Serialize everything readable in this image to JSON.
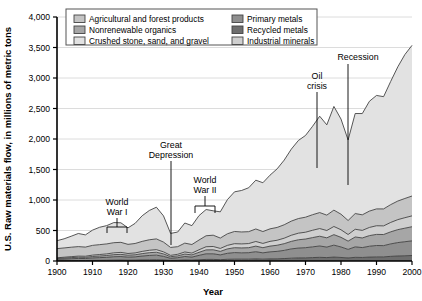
{
  "chart_data": {
    "type": "area",
    "title": "",
    "xlabel": "Year",
    "ylabel": "U.S. Raw materials flow, in millions of metric tons",
    "xlim": [
      1900,
      2000
    ],
    "ylim": [
      0,
      4000
    ],
    "xticks": [
      1900,
      1910,
      1920,
      1930,
      1940,
      1950,
      1960,
      1970,
      1980,
      1990,
      2000
    ],
    "xtick_labels": [
      "1900",
      "1910",
      "1920",
      "1930",
      "1940",
      "1950",
      "1960",
      "1970",
      "1980",
      "1990",
      "2000"
    ],
    "yticks": [
      0,
      500,
      1000,
      1500,
      2000,
      2500,
      3000,
      3500,
      4000
    ],
    "ytick_labels": [
      "0",
      "500",
      "1,000",
      "1,500",
      "2,000",
      "2,500",
      "3,000",
      "3,500",
      "4,000"
    ],
    "grid": "horizontal",
    "stacked": true,
    "legend_position": "top-inside",
    "x": [
      1900,
      1902,
      1904,
      1906,
      1908,
      1910,
      1912,
      1914,
      1916,
      1918,
      1920,
      1922,
      1924,
      1926,
      1928,
      1930,
      1932,
      1934,
      1936,
      1938,
      1940,
      1942,
      1944,
      1946,
      1948,
      1950,
      1952,
      1954,
      1956,
      1958,
      1960,
      1962,
      1964,
      1966,
      1968,
      1970,
      1972,
      1974,
      1976,
      1978,
      1980,
      1982,
      1984,
      1986,
      1988,
      1990,
      1992,
      1994,
      1996,
      1998,
      2000
    ],
    "series": [
      {
        "name": "Recycled metals",
        "color": "#6e6e6e",
        "values": [
          5,
          6,
          7,
          8,
          8,
          10,
          11,
          12,
          14,
          15,
          13,
          14,
          17,
          19,
          20,
          16,
          10,
          12,
          16,
          14,
          20,
          26,
          26,
          22,
          28,
          30,
          30,
          30,
          34,
          30,
          34,
          36,
          40,
          46,
          50,
          52,
          56,
          60,
          56,
          64,
          58,
          50,
          60,
          58,
          64,
          68,
          68,
          76,
          82,
          86,
          90
        ]
      },
      {
        "name": "Primary metals",
        "color": "#8f8f8f",
        "values": [
          22,
          26,
          30,
          34,
          32,
          40,
          44,
          48,
          56,
          58,
          50,
          54,
          64,
          72,
          76,
          60,
          34,
          42,
          58,
          50,
          72,
          92,
          92,
          78,
          98,
          108,
          104,
          106,
          118,
          104,
          116,
          122,
          134,
          152,
          162,
          166,
          176,
          186,
          172,
          196,
          172,
          140,
          172,
          162,
          178,
          186,
          184,
          204,
          220,
          230,
          240
        ]
      },
      {
        "name": "Nonrenewable organics",
        "color": "#a6a6a6",
        "values": [
          14,
          16,
          18,
          20,
          20,
          24,
          27,
          30,
          34,
          36,
          32,
          34,
          40,
          45,
          48,
          40,
          26,
          30,
          40,
          36,
          50,
          64,
          66,
          58,
          72,
          80,
          80,
          82,
          92,
          84,
          94,
          100,
          110,
          124,
          136,
          142,
          152,
          160,
          152,
          172,
          158,
          136,
          162,
          158,
          174,
          182,
          182,
          198,
          212,
          222,
          232
        ]
      },
      {
        "name": "Industrial minerals",
        "color": "#cfcfcf",
        "values": [
          12,
          14,
          16,
          18,
          18,
          22,
          24,
          26,
          30,
          32,
          28,
          30,
          36,
          40,
          42,
          34,
          22,
          26,
          34,
          30,
          42,
          52,
          54,
          48,
          58,
          66,
          66,
          68,
          76,
          70,
          78,
          82,
          90,
          100,
          108,
          112,
          120,
          126,
          120,
          134,
          124,
          108,
          126,
          124,
          134,
          142,
          142,
          154,
          164,
          172,
          178
        ]
      },
      {
        "name": "Agricultural and forest products",
        "color": "#c4c4c4",
        "values": [
          150,
          152,
          155,
          156,
          150,
          160,
          162,
          164,
          166,
          165,
          150,
          155,
          165,
          172,
          176,
          160,
          130,
          125,
          145,
          140,
          160,
          180,
          185,
          170,
          190,
          200,
          196,
          195,
          205,
          195,
          205,
          210,
          220,
          232,
          240,
          246,
          255,
          262,
          252,
          268,
          255,
          230,
          258,
          255,
          268,
          276,
          278,
          292,
          305,
          315,
          325
        ]
      },
      {
        "name": "Crushed stone, sand, and gravel",
        "color": "#e2e2e2",
        "values": [
          130,
          150,
          180,
          215,
          200,
          250,
          285,
          300,
          330,
          320,
          270,
          330,
          420,
          480,
          520,
          430,
          230,
          240,
          330,
          310,
          400,
          430,
          400,
          430,
          560,
          650,
          680,
          720,
          800,
          800,
          880,
          960,
          1060,
          1180,
          1280,
          1340,
          1450,
          1580,
          1480,
          1700,
          1560,
          1320,
          1640,
          1660,
          1800,
          1860,
          1840,
          2020,
          2200,
          2360,
          2470
        ]
      }
    ],
    "annotations": [
      {
        "label_lines": [
          "World",
          "War I"
        ],
        "text": "World War I",
        "bracket_from": 1914,
        "bracket_to": 1918
      },
      {
        "label_lines": [
          "Great",
          "Depression"
        ],
        "text": "Great Depression",
        "point_year": 1932
      },
      {
        "label_lines": [
          "World",
          "War II"
        ],
        "text": "World War II",
        "bracket_from": 1939,
        "bracket_to": 1945
      },
      {
        "label_lines": [
          "Oil",
          "crisis"
        ],
        "text": "Oil crisis",
        "point_year": 1974
      },
      {
        "label_lines": [
          "Recession"
        ],
        "text": "Recession",
        "point_year": 1982
      }
    ]
  },
  "legend": {
    "items": [
      {
        "label": "Agricultural and forest products",
        "color": "#c4c4c4"
      },
      {
        "label": "Nonrenewable organics",
        "color": "#a6a6a6"
      },
      {
        "label": "Crushed stone, sand, and gravel",
        "color": "#e2e2e2"
      },
      {
        "label": "Primary metals",
        "color": "#8f8f8f"
      },
      {
        "label": "Recycled metals",
        "color": "#6e6e6e"
      },
      {
        "label": "Industrial minerals",
        "color": "#cfcfcf"
      }
    ]
  },
  "annotation_text": {
    "world_war_i_line1": "World",
    "world_war_i_line2": "War I",
    "great_depression_line1": "Great",
    "great_depression_line2": "Depression",
    "world_war_ii_line1": "World",
    "world_war_ii_line2": "War II",
    "oil_crisis_line1": "Oil",
    "oil_crisis_line2": "crisis",
    "recession_line1": "Recession"
  },
  "axis_labels": {
    "x_title": "Year",
    "y_title": "U.S. Raw materials flow, in millions of metric tons"
  },
  "colors": {
    "grid": "#d8d8d8",
    "axis": "#000000",
    "plot_background": "#ffffff"
  }
}
